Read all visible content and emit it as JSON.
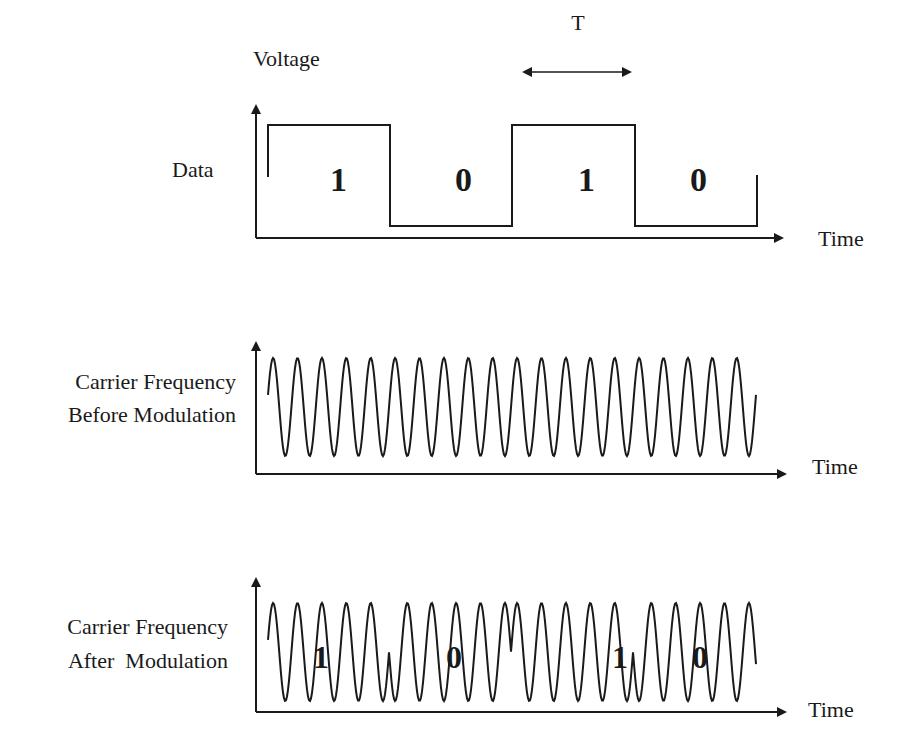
{
  "diagram": {
    "title_axis_label": "Voltage",
    "period_label": "T",
    "panels": [
      {
        "id": "data",
        "label_lines": [
          "Data"
        ],
        "x_axis_label": "Time",
        "bits": [
          "1",
          "0",
          "1",
          "0"
        ]
      },
      {
        "id": "carrier-before",
        "label_lines": [
          "Carrier Frequency",
          "Before Modulation"
        ],
        "x_axis_label": "Time"
      },
      {
        "id": "carrier-after",
        "label_lines": [
          "Carrier Frequency",
          "After  Modulation"
        ],
        "x_axis_label": "Time",
        "bits": [
          "1",
          "0",
          "1",
          "0"
        ]
      }
    ],
    "style": {
      "stroke_color": "#1a1a1a",
      "background": "#ffffff"
    }
  },
  "chart_data": {
    "type": "line",
    "series": [
      {
        "name": "Data",
        "bits": [
          1,
          0,
          1,
          0
        ],
        "levels": [
          "high",
          "low",
          "high",
          "low"
        ],
        "bit_period": "T"
      },
      {
        "name": "Carrier Frequency Before Modulation",
        "waveform": "sine",
        "cycles": 20
      },
      {
        "name": "Carrier Frequency After Modulation",
        "waveform": "sine",
        "cycles": 20,
        "phase_shift_at_bit_change_deg": 180
      }
    ],
    "xlabel": "Time",
    "ylabel": "Voltage"
  }
}
